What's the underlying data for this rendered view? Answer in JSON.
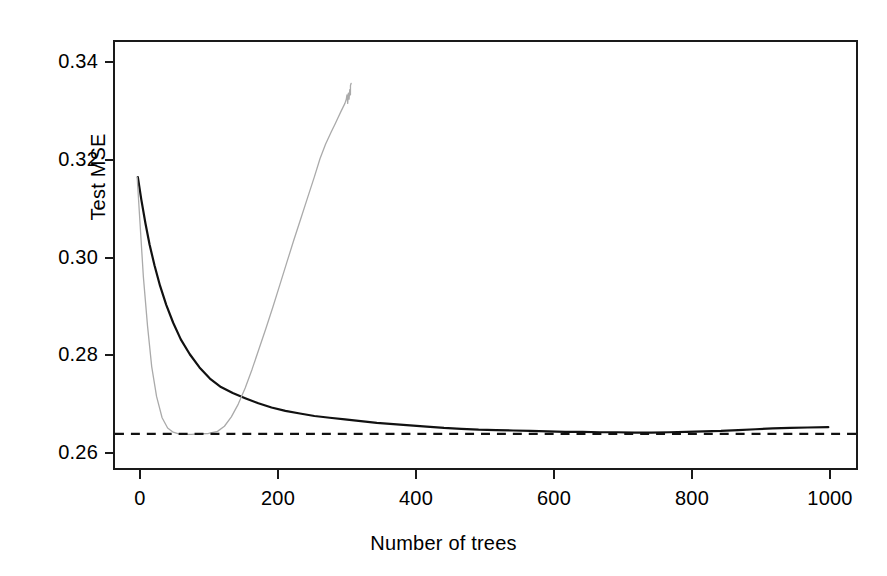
{
  "chart_data": {
    "type": "line",
    "title": "",
    "xlabel": "Number of trees",
    "ylabel": "Test MSE",
    "xlim": [
      -30,
      1040
    ],
    "ylim": [
      0.2512,
      0.3512
    ],
    "grid": false,
    "legend": "none",
    "xticks": [
      0,
      200,
      400,
      600,
      800,
      1000
    ],
    "xticklabels": [
      "0",
      "200",
      "400",
      "600",
      "800",
      "1000"
    ],
    "yticks": [
      0.26,
      0.28,
      0.3,
      0.32,
      0.34
    ],
    "yticklabels": [
      "0.26",
      "0.28",
      "0.30",
      "0.32",
      "0.34"
    ],
    "reference_line": {
      "name": "minimum-test-mse-reference",
      "orientation": "horizontal",
      "value": 0.2592,
      "style": "dashed",
      "color": "#111111"
    },
    "series": [
      {
        "name": "test-mse-curve",
        "label": "Test MSE",
        "color": "#111111",
        "width": 2.2,
        "style": "solid",
        "x": [
          3,
          8,
          14,
          20,
          27,
          35,
          44,
          54,
          65,
          78,
          92,
          107,
          123,
          140,
          158,
          177,
          196,
          216,
          237,
          258,
          280,
          302,
          325,
          348,
          372,
          396,
          420,
          445,
          470,
          495,
          520,
          545,
          570,
          595,
          620,
          645,
          670,
          695,
          720,
          745,
          770,
          795,
          820,
          845,
          870,
          895,
          920,
          945,
          970,
          1000
        ],
        "y": [
          0.3195,
          0.3142,
          0.3086,
          0.3036,
          0.2988,
          0.294,
          0.2895,
          0.2853,
          0.2814,
          0.2779,
          0.2748,
          0.2722,
          0.2702,
          0.2688,
          0.2676,
          0.2664,
          0.2654,
          0.2646,
          0.264,
          0.2634,
          0.263,
          0.2626,
          0.2622,
          0.2618,
          0.2615,
          0.2612,
          0.2609,
          0.2606,
          0.2604,
          0.2602,
          0.2601,
          0.26,
          0.2599,
          0.2598,
          0.2597,
          0.2597,
          0.2596,
          0.2596,
          0.2595,
          0.2595,
          0.2596,
          0.2597,
          0.2598,
          0.2599,
          0.2601,
          0.2603,
          0.2605,
          0.2606,
          0.2607,
          0.2608
        ]
      },
      {
        "name": "secondary-mse-curve",
        "label": "Secondary curve",
        "color": "#aaaaaa",
        "width": 1.3,
        "style": "solid",
        "x": [
          2,
          6,
          11,
          17,
          23,
          30,
          38,
          46,
          54,
          62,
          70,
          80,
          92,
          105,
          118,
          128,
          138,
          148,
          158,
          168,
          178,
          188,
          198,
          208,
          218,
          228,
          238,
          248,
          258,
          266,
          274,
          282,
          288,
          292,
          296,
          299,
          302,
          304,
          305,
          306,
          307,
          308,
          309,
          310,
          310,
          311
        ],
        "y": [
          0.3195,
          0.309,
          0.296,
          0.2845,
          0.275,
          0.268,
          0.263,
          0.2606,
          0.2596,
          0.2592,
          0.2591,
          0.2591,
          0.2592,
          0.2593,
          0.2598,
          0.261,
          0.2632,
          0.2662,
          0.27,
          0.2744,
          0.2792,
          0.284,
          0.289,
          0.2942,
          0.2994,
          0.3046,
          0.3096,
          0.3146,
          0.3196,
          0.3238,
          0.3272,
          0.33,
          0.332,
          0.3334,
          0.3348,
          0.3358,
          0.3368,
          0.3378,
          0.3388,
          0.3368,
          0.3392,
          0.3378,
          0.34,
          0.3388,
          0.341,
          0.3415
        ]
      }
    ]
  },
  "axes": {
    "y_title": "Test MSE",
    "x_title": "Number of trees"
  }
}
